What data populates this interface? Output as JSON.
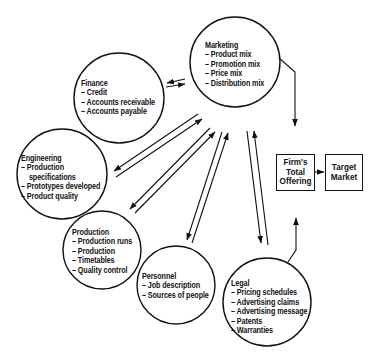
{
  "nodes": {
    "marketing": {
      "title": "Marketing",
      "items": [
        "– Product mix",
        "– Promotion mix",
        "– Price mix",
        "– Distribution mix"
      ]
    },
    "finance": {
      "title": "Finance",
      "items": [
        "– Credit",
        "– Accounts receivable",
        "– Accounts payable"
      ]
    },
    "engineering": {
      "title": "Engineering",
      "items": [
        "– Production",
        "   specifications",
        "– Prototypes developed",
        "– Product quality"
      ]
    },
    "production": {
      "title": "Production",
      "items": [
        "– Production runs",
        "– Production",
        "– Timetables",
        "– Quality control"
      ]
    },
    "personnel": {
      "title": "Personnel",
      "items": [
        "– Job description",
        "– Sources of people"
      ]
    },
    "legal": {
      "title": "Legal",
      "items": [
        "– Pricing schedules",
        "– Advertising claims",
        "– Advertising message",
        "– Patents",
        "– Warranties"
      ]
    }
  },
  "boxes": {
    "offering": {
      "lines": [
        "Firm's",
        "Total",
        "Offering"
      ]
    },
    "market": {
      "lines": [
        "Target",
        "Market"
      ]
    }
  },
  "colors": {
    "ink": "#111111",
    "background": "#ffffff"
  }
}
